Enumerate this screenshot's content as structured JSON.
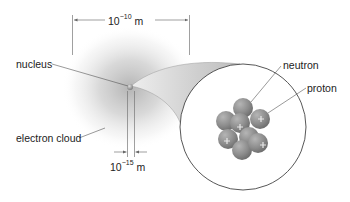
{
  "diagram": {
    "type": "atom-structure",
    "labels": {
      "nucleus": "nucleus",
      "electron_cloud": "electron cloud",
      "neutron": "neutron",
      "proton": "proton"
    },
    "dimensions": {
      "atom_size": {
        "base": "10",
        "exponent": "−10",
        "unit": " m"
      },
      "nucleus_size": {
        "base": "10",
        "exponent": "−15",
        "unit": " m"
      }
    },
    "colors": {
      "cloud": "#b8b8b8",
      "funnel": "#d0d0d0",
      "nucleon": "#8a8a8a",
      "line": "#555555",
      "text": "#222222"
    }
  }
}
